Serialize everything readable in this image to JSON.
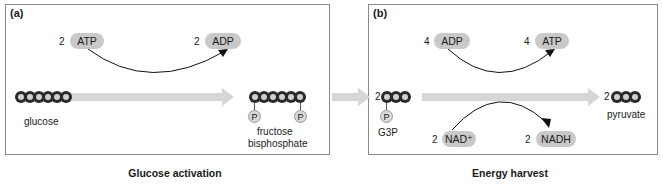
{
  "panels": {
    "a": {
      "label": "(a)",
      "caption": "Glucose activation",
      "input": {
        "coef": "2",
        "name": "ATP"
      },
      "output": {
        "coef": "2",
        "name": "ADP"
      },
      "left_molecule": {
        "name": "glucose",
        "carbons": 6
      },
      "right_molecule": {
        "name_line1": "fructose",
        "name_line2": "bisphosphate",
        "carbons": 6,
        "phosphates": [
          "P",
          "P"
        ]
      }
    },
    "b": {
      "label": "(b)",
      "caption": "Energy harvest",
      "input_top": {
        "coef": "4",
        "name": "ADP"
      },
      "output_top": {
        "coef": "4",
        "name": "ATP"
      },
      "input_bottom": {
        "coef": "2",
        "name": "NAD⁺"
      },
      "output_bottom": {
        "coef": "2",
        "name": "NADH"
      },
      "left_molecule": {
        "coef": "2",
        "name": "G3P",
        "carbons": 3,
        "phosphate": "P"
      },
      "right_molecule": {
        "coef": "2",
        "name": "pyruvate",
        "carbons": 3
      }
    }
  },
  "colors": {
    "carbon_dark": "#2a2a2a",
    "carbon_light": "#d0d0d0",
    "pill": "#c9c9c9",
    "arrow": "#d6d6d6",
    "border": "#8a8a8a"
  }
}
